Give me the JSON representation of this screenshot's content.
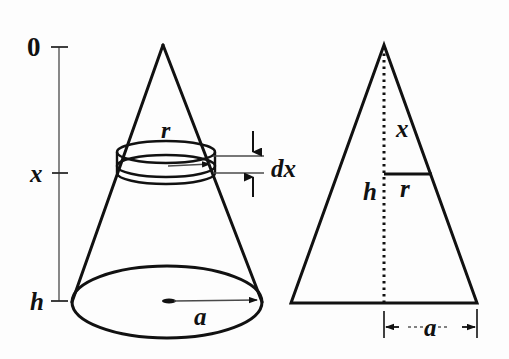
{
  "figure": {
    "background_color": "#fdfdfd",
    "stroke_color": "#111111",
    "axis_color": "#555555"
  },
  "axis": {
    "name": "vertical-depth-axis",
    "top_label": "0",
    "mid_label": "x",
    "bottom_label": "h",
    "top_tick_y": 47,
    "mid_tick_y": 173,
    "bottom_tick_y": 301,
    "line_x": 59
  },
  "cone": {
    "name": "3d-cone",
    "apex_label": "",
    "slab_top_label": "r",
    "slab_thickness_label": "dx",
    "base_radius_label": "a",
    "apex": {
      "x": 163,
      "y": 45
    },
    "base_center": {
      "x": 167,
      "y": 302
    },
    "base_rx": 95,
    "base_ry": 36,
    "slab_center_y": 163,
    "slab_rx": 49,
    "slab_ry": 11,
    "slab_height": 21
  },
  "triangle": {
    "name": "2d-cross-section-triangle",
    "apex_label": "",
    "height_upper_label": "x",
    "height_lower_label": "h",
    "mid_radius_label": "r",
    "base_half_label": "a",
    "apex": {
      "x": 384,
      "y": 45
    },
    "base_left": {
      "x": 291,
      "y": 303
    },
    "base_right": {
      "x": 477,
      "y": 303
    },
    "mid_line_y": 174,
    "mid_line_right_x": 432,
    "dim_a_y": 327
  },
  "labels": {
    "zero": "0",
    "x": "x",
    "h": "h",
    "r": "r",
    "a": "a",
    "dx": "dx"
  }
}
